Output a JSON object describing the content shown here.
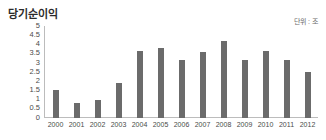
{
  "header": {
    "title": "당기순이익",
    "unit_label": "단위 : 조"
  },
  "chart_data": {
    "type": "bar",
    "title": "당기순이익",
    "subtitle": "단위 : 조",
    "xlabel": "",
    "ylabel": "",
    "unit": "조",
    "grid": false,
    "legend": null,
    "legend_position": "none",
    "bar_color": "#6b6b6b",
    "axis_color": "#bcbcbc",
    "ylim": [
      0,
      5
    ],
    "ytick_step": 0.5,
    "yticks": [
      "5",
      "4.5",
      "4",
      "3.5",
      "3",
      "2.5",
      "2",
      "1.5",
      "1",
      "0.5",
      "0"
    ],
    "ytick_values": [
      5,
      4.5,
      4,
      3.5,
      3,
      2.5,
      2,
      1.5,
      1,
      0.5,
      0
    ],
    "categories": [
      "2000",
      "2001",
      "2002",
      "2003",
      "2004",
      "2005",
      "2006",
      "2007",
      "2008",
      "2009",
      "2010",
      "2011",
      "2012"
    ],
    "values": [
      1.5,
      0.8,
      0.95,
      1.9,
      3.65,
      3.8,
      3.15,
      3.6,
      4.2,
      3.15,
      3.65,
      3.15,
      2.5
    ]
  }
}
